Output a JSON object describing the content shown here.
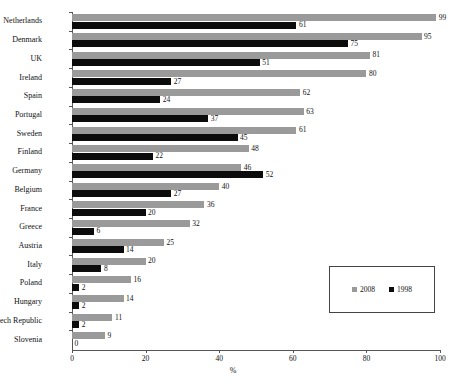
{
  "chart_data": {
    "type": "bar",
    "orientation": "horizontal",
    "title": "",
    "xlabel": "%",
    "ylabel": "",
    "xlim": [
      0,
      100
    ],
    "xticks": [
      0,
      20,
      40,
      60,
      80,
      100
    ],
    "grid": false,
    "legend_position": "bottom-right",
    "categories": [
      "Netherlands",
      "Denmark",
      "UK",
      "Ireland",
      "Spain",
      "Portugal",
      "Sweden",
      "Finland",
      "Germany",
      "Belgium",
      "France",
      "Greece",
      "Austria",
      "Italy",
      "Poland",
      "Hungary",
      "Czech Republic",
      "Slovenia"
    ],
    "series": [
      {
        "name": "2008",
        "color": "#9a9a9a",
        "values": [
          99,
          95,
          81,
          80,
          62,
          63,
          61,
          48,
          46,
          40,
          36,
          32,
          25,
          20,
          16,
          14,
          11,
          9
        ]
      },
      {
        "name": "1998",
        "color": "#0c0c0c",
        "values": [
          61,
          75,
          51,
          27,
          24,
          37,
          45,
          22,
          52,
          27,
          20,
          6,
          14,
          8,
          2,
          2,
          2,
          0
        ]
      }
    ]
  },
  "legend": {
    "entries": [
      {
        "label": "2008",
        "color": "#9a9a9a"
      },
      {
        "label": "1998",
        "color": "#0c0c0c"
      }
    ]
  }
}
